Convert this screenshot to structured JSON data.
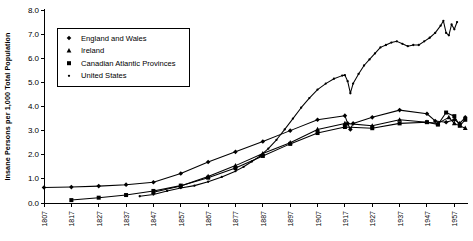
{
  "chart_data": {
    "type": "line",
    "title": "",
    "xlabel": "",
    "ylabel": "Insane Persons per 1,000 Total Population",
    "xlim": [
      1807,
      1962
    ],
    "ylim": [
      0.0,
      8.0
    ],
    "grid": false,
    "legend_position": "top-left",
    "y_ticks": [
      "0.0",
      "1.0",
      "2.0",
      "3.0",
      "4.0",
      "5.0",
      "6.0",
      "7.0",
      "8.0"
    ],
    "x_ticks": [
      "1807",
      "1817",
      "1827",
      "1837",
      "1847",
      "1857",
      "1867",
      "1877",
      "1887",
      "1897",
      "1907",
      "1917",
      "1927",
      "1937",
      "1947",
      "1957"
    ],
    "series": [
      {
        "name": "England and Wales",
        "marker": "diamond",
        "points": [
          [
            1807,
            0.64
          ],
          [
            1817,
            0.66
          ],
          [
            1827,
            0.7
          ],
          [
            1837,
            0.76
          ],
          [
            1847,
            0.86
          ],
          [
            1857,
            1.22
          ],
          [
            1867,
            1.7
          ],
          [
            1877,
            2.12
          ],
          [
            1887,
            2.55
          ],
          [
            1897,
            3.0
          ],
          [
            1907,
            3.45
          ],
          [
            1917,
            3.62
          ],
          [
            1918,
            3.3
          ],
          [
            1919,
            3.05
          ],
          [
            1920,
            3.3
          ],
          [
            1927,
            3.55
          ],
          [
            1937,
            3.85
          ],
          [
            1947,
            3.7
          ],
          [
            1950,
            3.4
          ],
          [
            1954,
            3.35
          ],
          [
            1957,
            3.45
          ],
          [
            1959,
            3.3
          ],
          [
            1961,
            3.55
          ]
        ]
      },
      {
        "name": "Ireland",
        "marker": "triangle",
        "points": [
          [
            1847,
            0.45
          ],
          [
            1857,
            0.7
          ],
          [
            1867,
            1.1
          ],
          [
            1877,
            1.55
          ],
          [
            1887,
            2.05
          ],
          [
            1897,
            2.5
          ],
          [
            1907,
            3.05
          ],
          [
            1917,
            3.3
          ],
          [
            1927,
            3.2
          ],
          [
            1937,
            3.45
          ],
          [
            1947,
            3.35
          ],
          [
            1951,
            3.3
          ],
          [
            1955,
            3.55
          ],
          [
            1957,
            3.3
          ],
          [
            1961,
            3.1
          ]
        ]
      },
      {
        "name": "Canadian Atlantic Provinces",
        "marker": "square",
        "points": [
          [
            1817,
            0.12
          ],
          [
            1827,
            0.22
          ],
          [
            1837,
            0.33
          ],
          [
            1847,
            0.5
          ],
          [
            1857,
            0.72
          ],
          [
            1867,
            1.05
          ],
          [
            1877,
            1.45
          ],
          [
            1887,
            1.95
          ],
          [
            1897,
            2.45
          ],
          [
            1907,
            2.9
          ],
          [
            1917,
            3.15
          ],
          [
            1927,
            3.1
          ],
          [
            1937,
            3.3
          ],
          [
            1947,
            3.35
          ],
          [
            1951,
            3.25
          ],
          [
            1954,
            3.75
          ],
          [
            1957,
            3.6
          ],
          [
            1959,
            3.2
          ],
          [
            1961,
            3.45
          ]
        ]
      },
      {
        "name": "United States",
        "marker": "dot",
        "points": [
          [
            1842,
            0.28
          ],
          [
            1847,
            0.35
          ],
          [
            1852,
            0.5
          ],
          [
            1857,
            0.62
          ],
          [
            1862,
            0.72
          ],
          [
            1867,
            0.88
          ],
          [
            1872,
            1.08
          ],
          [
            1877,
            1.32
          ],
          [
            1880,
            1.5
          ],
          [
            1883,
            1.72
          ],
          [
            1886,
            1.95
          ],
          [
            1889,
            2.25
          ],
          [
            1892,
            2.62
          ],
          [
            1895,
            3.05
          ],
          [
            1898,
            3.5
          ],
          [
            1901,
            3.95
          ],
          [
            1904,
            4.35
          ],
          [
            1907,
            4.7
          ],
          [
            1910,
            4.95
          ],
          [
            1913,
            5.15
          ],
          [
            1916,
            5.28
          ],
          [
            1917,
            5.3
          ],
          [
            1918,
            5.05
          ],
          [
            1919,
            4.55
          ],
          [
            1920,
            4.95
          ],
          [
            1922,
            5.35
          ],
          [
            1924,
            5.7
          ],
          [
            1926,
            5.95
          ],
          [
            1928,
            6.2
          ],
          [
            1930,
            6.45
          ],
          [
            1932,
            6.55
          ],
          [
            1934,
            6.65
          ],
          [
            1936,
            6.7
          ],
          [
            1938,
            6.6
          ],
          [
            1940,
            6.5
          ],
          [
            1942,
            6.55
          ],
          [
            1944,
            6.55
          ],
          [
            1946,
            6.7
          ],
          [
            1948,
            6.85
          ],
          [
            1950,
            7.05
          ],
          [
            1952,
            7.35
          ],
          [
            1953,
            7.55
          ],
          [
            1954,
            7.05
          ],
          [
            1955,
            6.95
          ],
          [
            1956,
            7.4
          ],
          [
            1957,
            7.2
          ],
          [
            1958,
            7.5
          ]
        ]
      }
    ]
  },
  "legend": {
    "items": [
      {
        "label": "England and Wales",
        "marker": "diamond"
      },
      {
        "label": "Ireland",
        "marker": "triangle"
      },
      {
        "label": "Canadian Atlantic Provinces",
        "marker": "square"
      },
      {
        "label": "United States",
        "marker": "dot"
      }
    ]
  }
}
